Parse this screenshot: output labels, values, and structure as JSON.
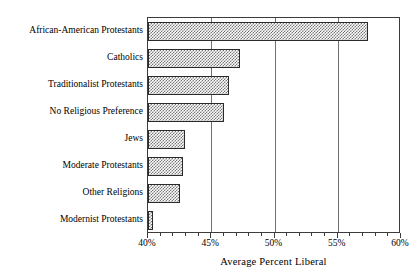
{
  "chart_data": {
    "type": "bar",
    "orientation": "horizontal",
    "title": "",
    "xlabel": "Average Percent Liberal",
    "ylabel": "",
    "xlim": [
      40,
      60
    ],
    "xtick_step_major": 5,
    "xtick_step_minor": 1,
    "xtick_labels": [
      "40%",
      "45%",
      "50%",
      "55%",
      "60%"
    ],
    "xtick_values": [
      40,
      45,
      50,
      55,
      60
    ],
    "grid": true,
    "grid_axis": "x",
    "legend": false,
    "categories": [
      "African-American Protestants",
      "Catholics",
      "Traditionalist Protestants",
      "No Religious Preference",
      "Jews",
      "Moderate Protestants",
      "Other Religions",
      "Modernist Protestants"
    ],
    "values": [
      57.4,
      47.3,
      46.4,
      46.0,
      42.9,
      42.8,
      42.5,
      40.4
    ],
    "bar_fill": "checkerboard-hatch",
    "bar_fill_color": "#767676",
    "bar_edge_color": "#2a2a2a",
    "background_color": "#ffffff"
  }
}
